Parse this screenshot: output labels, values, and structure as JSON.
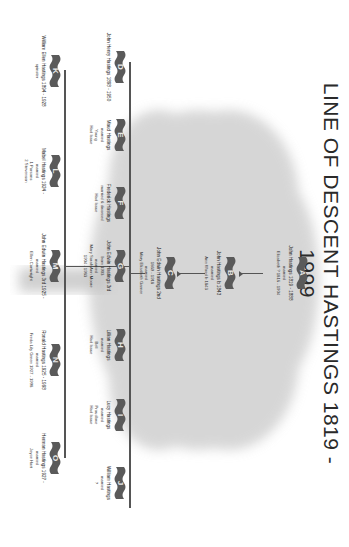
{
  "title": "LINE OF DESCENT  HASTINGS 1819 - 1999",
  "colors": {
    "banner": "#5a5a5a",
    "line": "#555555",
    "tree": "#bdbdbd",
    "text": "#222222"
  },
  "tiers": {
    "tier1": [
      {
        "letter": "A",
        "name": "John Hastings  1819 - 1888",
        "rel": "married",
        "spouse": "Elizabeth ?  1816 - 1904",
        "extra": ""
      }
    ],
    "tier2": [
      {
        "letter": "B",
        "name": "John Hastings  b 1843",
        "rel": "married",
        "spouse": "Ann Wood  b 1843",
        "extra": ""
      }
    ],
    "tier3": [
      {
        "letter": "C",
        "name": "John Edwin Hastings 2nd",
        "dates": "1869 - 1918",
        "rel": "married",
        "spouse": "Mary Elizabeth Garner"
      }
    ],
    "tier4": [
      {
        "letter": "D",
        "name": "John Henry Hastings  1898 - 1950",
        "rel": "",
        "spouse": "",
        "extra": ""
      },
      {
        "letter": "E",
        "name": "Maud Hastings",
        "rel": "married",
        "spouse": "Young",
        "extra": "Had Issue"
      },
      {
        "letter": "F",
        "name": "Frederick Hastings",
        "rel": "married & divorced",
        "spouse": "",
        "extra": "Had Issue"
      },
      {
        "letter": "G",
        "name": "John Edwin Hastings 3rd",
        "dates": "born 1903",
        "rel": "married",
        "spouse": "Mary Sarah Ann Moore",
        "extra": "1904 - 1983"
      },
      {
        "letter": "H",
        "name": "Lillian Hastings",
        "rel": "married",
        "spouse": "Bell",
        "extra": "Had Issue"
      },
      {
        "letter": "I",
        "name": "Lucy Hastings",
        "rel": "married",
        "spouse": "Proudlove",
        "extra": "Had Issue"
      },
      {
        "letter": "J",
        "name": "William Hastings",
        "rel": "married",
        "spouse": "?",
        "extra": ""
      }
    ],
    "tier5": [
      {
        "letter": "K",
        "name": "William Ellen Hastings  1894 - 1928",
        "rel": "spinster",
        "spouse": "",
        "extra": ""
      },
      {
        "letter": "L",
        "name": "Mabel Hastings  1924 -",
        "rel": "married",
        "spouse": "1 Parsons",
        "extra": "2 Stevenson"
      },
      {
        "letter": "M",
        "name": "John Edwin Hastings 3rd  1925 -",
        "rel": "married",
        "spouse": "Ellen Cartwright",
        "extra": ""
      },
      {
        "letter": "N",
        "name": "Ronald Hastings  1925 - 1998",
        "rel": "married",
        "spouse": "Freda Lily Green  1927 - 1998",
        "extra": ""
      },
      {
        "letter": "O",
        "name": "Herman Hastings  1927 -",
        "rel": "married",
        "spouse": "Joyce Hart",
        "extra": ""
      }
    ]
  }
}
